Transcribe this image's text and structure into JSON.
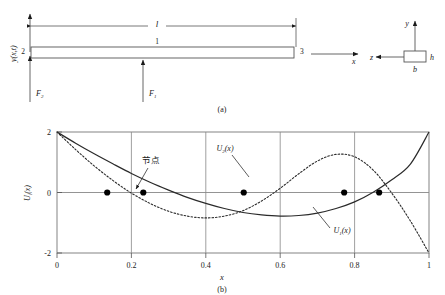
{
  "figure": {
    "panel_a": {
      "caption": "(a)",
      "beam": {
        "length_label": "l",
        "element_label": "1",
        "node_left_label": "2",
        "node_right_label": "3",
        "force_left_label": "F",
        "force_left_sub": "2",
        "force_mid_label": "F",
        "force_mid_sub": "1",
        "deflection_label": "y(x,t)",
        "axis_x_label": "x"
      },
      "cross_section": {
        "axis_y_label": "y",
        "axis_z_label": "z",
        "height_label": "h",
        "width_label": "b"
      }
    },
    "panel_b": {
      "caption": "(b)",
      "annotation_node": "节点",
      "curve1_label": "U",
      "curve1_sub": "1",
      "curve1_suffix": "(x)",
      "curve2_label": "U",
      "curve2_sub": "2",
      "curve2_suffix": "(x)"
    }
  },
  "chart_data": {
    "type": "line",
    "title": "",
    "xlabel": "x",
    "ylabel": "U",
    "ylabel_sub": "i",
    "ylabel_suffix": "(x)",
    "xlim": [
      0,
      1
    ],
    "ylim": [
      -2,
      2
    ],
    "xticks": [
      "0",
      "0.2",
      "0.4",
      "0.6",
      "0.8",
      "1"
    ],
    "xtick_values": [
      0,
      0.2,
      0.4,
      0.6,
      0.8,
      1
    ],
    "yticks": [
      "2",
      "0",
      "-2"
    ],
    "ytick_values": [
      2,
      0,
      -2
    ],
    "grid": true,
    "legend_position": "inline-annotations",
    "series": [
      {
        "name": "U1(x)",
        "style": "solid",
        "color": "#2a2a2a",
        "x": [
          0,
          0.05,
          0.1,
          0.15,
          0.2,
          0.25,
          0.3,
          0.35,
          0.4,
          0.45,
          0.5,
          0.55,
          0.6,
          0.65,
          0.7,
          0.75,
          0.8,
          0.85,
          0.9,
          0.95,
          1.0
        ],
        "y": [
          2.0,
          1.63,
          1.28,
          0.95,
          0.63,
          0.34,
          0.08,
          -0.16,
          -0.36,
          -0.53,
          -0.66,
          -0.74,
          -0.78,
          -0.76,
          -0.68,
          -0.53,
          -0.31,
          0.01,
          0.42,
          0.94,
          2.0
        ]
      },
      {
        "name": "U2(x)",
        "style": "dotted",
        "color": "#2a2a2a",
        "x": [
          0,
          0.05,
          0.1,
          0.15,
          0.2,
          0.25,
          0.3,
          0.35,
          0.4,
          0.45,
          0.5,
          0.55,
          0.6,
          0.65,
          0.7,
          0.75,
          0.8,
          0.85,
          0.9,
          0.95,
          1.0
        ],
        "y": [
          2.0,
          1.42,
          0.88,
          0.4,
          -0.02,
          -0.36,
          -0.62,
          -0.78,
          -0.84,
          -0.78,
          -0.6,
          -0.28,
          0.14,
          0.62,
          1.04,
          1.26,
          1.18,
          0.74,
          -0.02,
          -0.94,
          -2.0
        ]
      }
    ],
    "markers": [
      {
        "x": 0.135,
        "y": 0,
        "label": "node"
      },
      {
        "x": 0.232,
        "y": 0,
        "label": "node"
      },
      {
        "x": 0.502,
        "y": 0,
        "label": "node"
      },
      {
        "x": 0.772,
        "y": 0,
        "label": "node"
      },
      {
        "x": 0.866,
        "y": 0,
        "label": "node"
      }
    ]
  }
}
